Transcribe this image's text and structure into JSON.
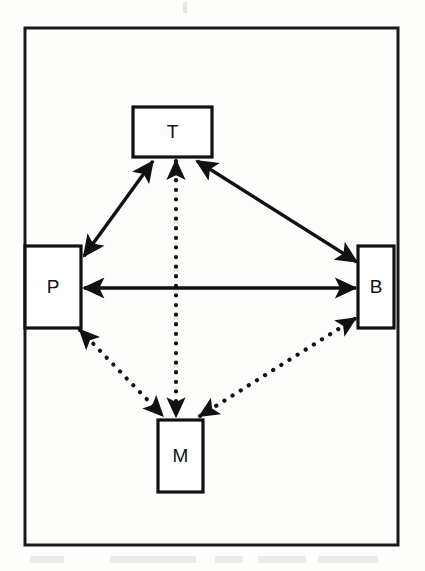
{
  "diagram": {
    "frame": {
      "name": "outer-border",
      "x": 25,
      "y": 28,
      "width": 373,
      "height": 517,
      "stroke_color": "#1a1a1a",
      "stroke_width": 3
    },
    "background_color": "#fdfdfc",
    "nodes": [
      {
        "id": "T",
        "label": "T",
        "position": "top",
        "x": 133,
        "y": 107,
        "width": 79,
        "height": 50,
        "stroke_color": "#111111",
        "fill_color": "#ffffff",
        "stroke_width": 3.2
      },
      {
        "id": "P",
        "label": "P",
        "position": "left",
        "x": 25,
        "y": 246,
        "width": 56,
        "height": 82,
        "stroke_color": "#111111",
        "fill_color": "#ffffff",
        "stroke_width": 3.2
      },
      {
        "id": "B",
        "label": "B",
        "position": "right",
        "x": 358,
        "y": 246,
        "width": 36,
        "height": 82,
        "stroke_color": "#111111",
        "fill_color": "#ffffff",
        "stroke_width": 3.2
      },
      {
        "id": "M",
        "label": "M",
        "position": "bottom",
        "x": 158,
        "y": 420,
        "width": 45,
        "height": 72,
        "stroke_color": "#111111",
        "fill_color": "#ffffff",
        "stroke_width": 3.2
      }
    ],
    "edges": [
      {
        "id": "P-T",
        "from": "P",
        "to": "T",
        "style": "solid",
        "direction": "bidirectional",
        "x1": 84,
        "y1": 256,
        "x2": 153,
        "y2": 161,
        "color": "#111111"
      },
      {
        "id": "T-B",
        "from": "T",
        "to": "B",
        "style": "solid",
        "direction": "bidirectional",
        "x1": 197,
        "y1": 161,
        "x2": 357,
        "y2": 262,
        "color": "#111111"
      },
      {
        "id": "P-B",
        "from": "P",
        "to": "B",
        "style": "solid",
        "direction": "bidirectional",
        "x1": 84,
        "y1": 288,
        "x2": 356,
        "y2": 288,
        "color": "#111111"
      },
      {
        "id": "T-M",
        "from": "T",
        "to": "M",
        "style": "dotted",
        "direction": "bidirectional",
        "x1": 176,
        "y1": 161,
        "x2": 176,
        "y2": 417,
        "color": "#111111"
      },
      {
        "id": "P-M",
        "from": "P",
        "to": "M",
        "style": "dotted",
        "direction": "bidirectional",
        "x1": 80,
        "y1": 330,
        "x2": 163,
        "y2": 416,
        "color": "#111111"
      },
      {
        "id": "M-B",
        "from": "M",
        "to": "B",
        "style": "dotted",
        "direction": "bidirectional",
        "x1": 200,
        "y1": 416,
        "x2": 356,
        "y2": 318,
        "color": "#111111"
      }
    ]
  }
}
